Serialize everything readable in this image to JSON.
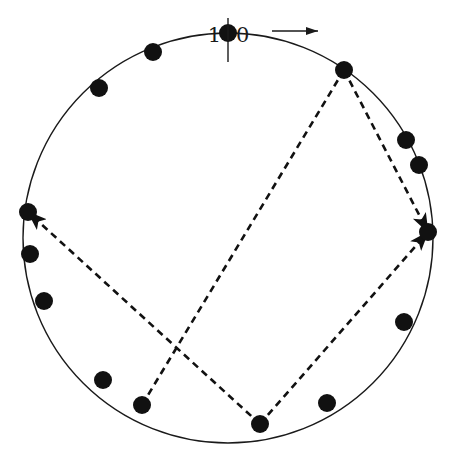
{
  "figure": {
    "title_label_left": "1",
    "title_label_right": "0",
    "divider": "vertical-tick",
    "direction_arrow": "rightward-arrow",
    "background_color": "#ffffff",
    "ink_color": "#1a1a1a",
    "node_color": "#111111"
  },
  "chart_data": {
    "type": "scatter",
    "title": "",
    "xlabel": "",
    "ylabel": "",
    "grid": false,
    "legend": null,
    "circle": {
      "center_x": 228,
      "center_y": 238,
      "radius": 205,
      "stroke_width": 1.4
    },
    "node_radius": 9,
    "node_count": 16,
    "angles_deg": [
      78,
      101,
      124,
      146,
      168,
      191,
      214,
      237,
      259,
      282,
      305,
      328,
      350,
      12,
      34,
      56
    ],
    "nodes": [
      {
        "id": 0,
        "x": 228,
        "y": 33,
        "angle": 90,
        "label": ""
      },
      {
        "id": 1,
        "x": 153,
        "y": 52,
        "angle": 111.5,
        "label": ""
      },
      {
        "id": 2,
        "x": 99,
        "y": 88,
        "angle": 133,
        "label": ""
      },
      {
        "id": 3,
        "x": 28,
        "y": 212,
        "angle": 187,
        "label": ""
      },
      {
        "id": 4,
        "x": 30,
        "y": 254,
        "angle": 194,
        "label": ""
      },
      {
        "id": 5,
        "x": 44,
        "y": 301,
        "angle": 207,
        "label": ""
      },
      {
        "id": 6,
        "x": 103,
        "y": 380,
        "angle": 234,
        "label": ""
      },
      {
        "id": 7,
        "x": 142,
        "y": 405,
        "angle": 245,
        "label": ""
      },
      {
        "id": 8,
        "x": 260,
        "y": 424,
        "angle": 279,
        "label": ""
      },
      {
        "id": 9,
        "x": 327,
        "y": 403,
        "angle": 296,
        "label": ""
      },
      {
        "id": 10,
        "x": 404,
        "y": 322,
        "angle": 336,
        "label": ""
      },
      {
        "id": 11,
        "x": 428,
        "y": 232,
        "angle": 358,
        "label": ""
      },
      {
        "id": 12,
        "x": 419,
        "y": 165,
        "angle": 19,
        "label": ""
      },
      {
        "id": 13,
        "x": 406,
        "y": 140,
        "angle": 27,
        "label": ""
      },
      {
        "id": 14,
        "x": 344,
        "y": 70,
        "angle": 55,
        "label": ""
      }
    ],
    "path_vertices": [
      0,
      8,
      11,
      3
    ],
    "edges": [
      {
        "from_x": 344,
        "from_y": 70,
        "to_x": 142,
        "to_y": 405,
        "style": "dashed",
        "arrow": false
      },
      {
        "from_x": 344,
        "from_y": 70,
        "to_x": 428,
        "to_y": 232,
        "style": "dashed",
        "arrow": true
      },
      {
        "from_x": 260,
        "from_y": 424,
        "to_x": 428,
        "to_y": 232,
        "style": "dashed",
        "arrow": true
      },
      {
        "from_x": 260,
        "from_y": 424,
        "to_x": 28,
        "to_y": 212,
        "style": "dashed",
        "arrow": true
      }
    ],
    "marker_tick": {
      "x": 228,
      "y_top": 18,
      "y_bottom": 62
    },
    "arrow_indicator": {
      "x_start": 272,
      "x_end": 318,
      "y": 31
    }
  }
}
